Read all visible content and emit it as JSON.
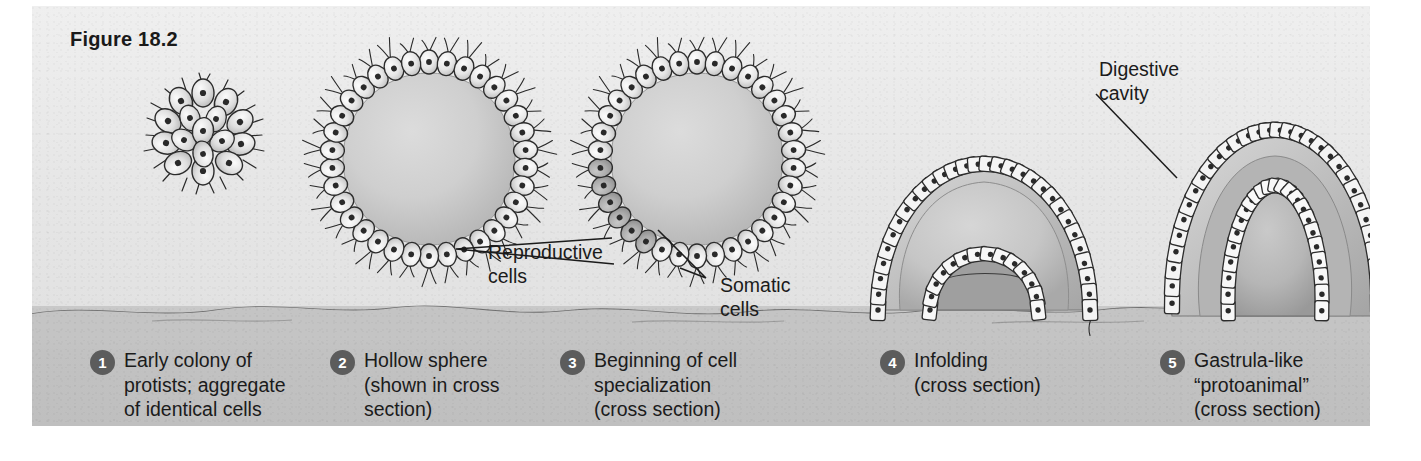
{
  "figure": {
    "title": "Figure 18.2",
    "panel_bg_color": "#e9e9e9",
    "seafloor_color": "#c4c4c4",
    "badge_color": "#5c5c5c",
    "ink_color": "#1b1b1b"
  },
  "annotations": [
    {
      "id": "reproductive",
      "label": "Reproductive\ncells"
    },
    {
      "id": "somatic",
      "label": "Somatic\ncells"
    },
    {
      "id": "digestive",
      "label": "Digestive\ncavity"
    }
  ],
  "annotation_labels": {
    "reproductive": "Reproductive\ncells",
    "somatic": "Somatic\ncells",
    "digestive": "Digestive\ncavity"
  },
  "stages": [
    {
      "number": "1",
      "caption": "Early colony of\nprotists; aggregate\nof  identical cells",
      "diagram": "cell-cluster"
    },
    {
      "number": "2",
      "caption": "Hollow sphere\n(shown in cross\nsection)",
      "diagram": "hollow-sphere"
    },
    {
      "number": "3",
      "caption": "Beginning of cell\nspecialization\n(cross section)",
      "diagram": "specialized-sphere"
    },
    {
      "number": "4",
      "caption": "Infolding\n(cross section)",
      "diagram": "infolding"
    },
    {
      "number": "5",
      "caption": "Gastrula-like\n“protoanimal”\n(cross section)",
      "diagram": "gastrula"
    }
  ]
}
